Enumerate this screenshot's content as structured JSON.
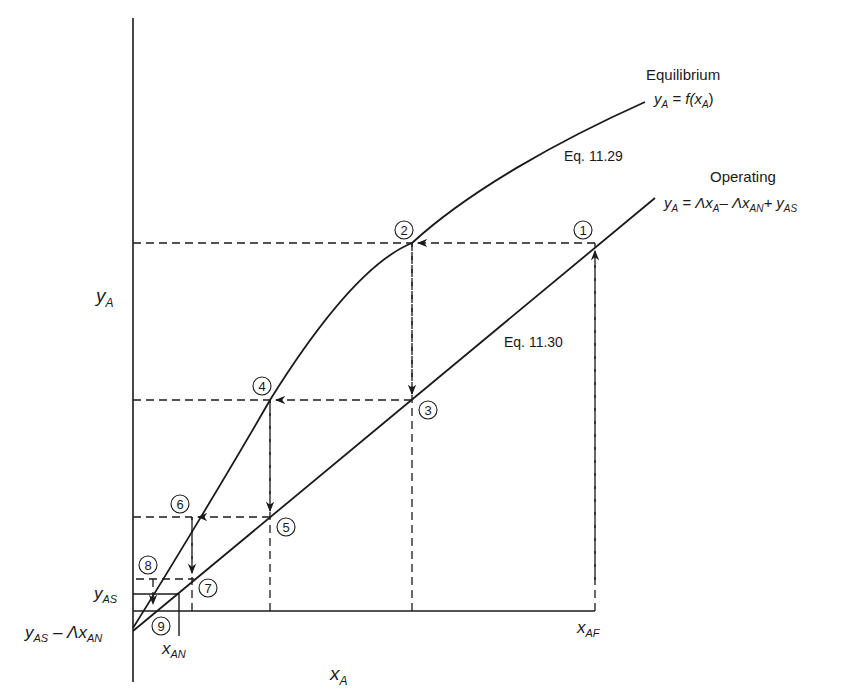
{
  "figure": {
    "type": "McCabe-Thiele style stage-stepping diagram",
    "axes": {
      "x_label": "x",
      "x_label_sub": "A",
      "y_label": "y",
      "y_label_sub": "A"
    },
    "curves": {
      "equilibrium": {
        "title": "Equilibrium",
        "eq_lhs": "y",
        "eq_lhs_sub": "A",
        "eq_mid": " = f(x",
        "eq_mid_sub": "A",
        "eq_end": ")",
        "ref": "Eq. 11.29"
      },
      "operating": {
        "title": "Operating",
        "eq_y": "y",
        "eq_y_sub": "A",
        "eq_eq": " = Λx",
        "eq_xa_sub": "A",
        "eq_minus": "– Λx",
        "eq_xan_sub": "AN",
        "eq_plus": "+ y",
        "eq_yas_sub": "AS",
        "ref": "Eq. 11.30"
      }
    },
    "axis_marks": {
      "y_as": "y",
      "y_as_sub": "AS",
      "y_intercept": "y",
      "y_intercept_sub": "AS",
      "y_intercept_rest": " – Λx",
      "y_intercept_rest_sub": "AN",
      "x_an": "x",
      "x_an_sub": "AN",
      "x_af": "x",
      "x_af_sub": "AF"
    },
    "stages": [
      "1",
      "2",
      "3",
      "4",
      "5",
      "6",
      "7",
      "8",
      "9"
    ],
    "colors": {
      "ink": "#1a1a1a",
      "background": "#ffffff"
    }
  }
}
